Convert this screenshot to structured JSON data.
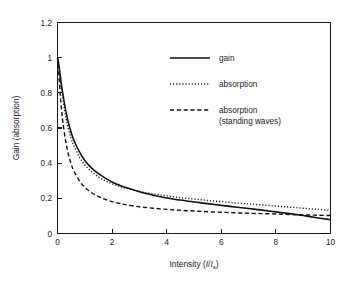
{
  "chart_data": {
    "type": "line",
    "title": "",
    "xlabel": "Intensity (I/I_s)",
    "xlabel_main": "Intensity (",
    "xlabel_var": "I",
    "xlabel_slash": "/",
    "xlabel_var2": "I",
    "xlabel_sub": "s",
    "xlabel_close": ")",
    "ylabel": "Gain (absorption)",
    "xlim": [
      0,
      10
    ],
    "ylim": [
      0,
      1.2
    ],
    "xticks": [
      0,
      2,
      4,
      6,
      8,
      10
    ],
    "xtick_labels": [
      "0",
      "2",
      "4",
      "6",
      "8",
      "10"
    ],
    "yticks": [
      0,
      0.2,
      0.4,
      0.6,
      0.8,
      1,
      1.2
    ],
    "ytick_labels": [
      "0",
      "0.2",
      "0.4",
      "0.6",
      "0.8",
      "1",
      "1.2"
    ],
    "grid": false,
    "legend_position": "upper right",
    "frame": "box",
    "series": [
      {
        "name": "gain",
        "style": "solid",
        "color": "#111111",
        "x": [
          0,
          0.05,
          0.1,
          0.15,
          0.2,
          0.3,
          0.4,
          0.5,
          0.6,
          0.8,
          1.0,
          1.25,
          1.5,
          1.75,
          2.0,
          2.25,
          2.5,
          3.0,
          3.5,
          4.0,
          4.5,
          5.0,
          5.5,
          6.0,
          6.5,
          7.0,
          7.5,
          8.0,
          8.5,
          9.0,
          9.5,
          10.0
        ],
        "y": [
          1.0,
          0.96,
          0.9,
          0.84,
          0.79,
          0.7,
          0.63,
          0.575,
          0.53,
          0.465,
          0.415,
          0.372,
          0.34,
          0.315,
          0.293,
          0.276,
          0.262,
          0.237,
          0.218,
          0.202,
          0.19,
          0.179,
          0.17,
          0.16,
          0.151,
          0.142,
          0.133,
          0.123,
          0.113,
          0.102,
          0.09,
          0.079
        ]
      },
      {
        "name": "absorption",
        "style": "dotted",
        "color": "#111111",
        "x": [
          0,
          0.05,
          0.1,
          0.15,
          0.2,
          0.3,
          0.4,
          0.5,
          0.6,
          0.8,
          1.0,
          1.25,
          1.5,
          1.75,
          2.0,
          2.25,
          2.5,
          3.0,
          3.5,
          4.0,
          4.5,
          5.0,
          5.5,
          6.0,
          6.5,
          7.0,
          7.5,
          8.0,
          8.5,
          9.0,
          9.5,
          10.0
        ],
        "y": [
          1.0,
          0.94,
          0.875,
          0.815,
          0.76,
          0.665,
          0.595,
          0.54,
          0.5,
          0.435,
          0.39,
          0.352,
          0.322,
          0.3,
          0.283,
          0.269,
          0.258,
          0.24,
          0.226,
          0.214,
          0.204,
          0.196,
          0.188,
          0.181,
          0.174,
          0.168,
          0.162,
          0.156,
          0.15,
          0.144,
          0.138,
          0.132
        ]
      },
      {
        "name": "absorption (standing waves)",
        "style": "dashed",
        "color": "#111111",
        "label_line1": "absorption",
        "label_line2": "(standing waves)",
        "x": [
          0,
          0.05,
          0.1,
          0.15,
          0.2,
          0.3,
          0.4,
          0.5,
          0.6,
          0.8,
          1.0,
          1.25,
          1.5,
          1.75,
          2.0,
          2.25,
          2.5,
          3.0,
          3.5,
          4.0,
          4.5,
          5.0,
          5.5,
          6.0,
          6.5,
          7.0,
          7.5,
          8.0,
          8.5,
          9.0,
          9.5,
          10.0
        ],
        "y": [
          1.0,
          0.9,
          0.79,
          0.7,
          0.63,
          0.525,
          0.45,
          0.395,
          0.355,
          0.3,
          0.262,
          0.232,
          0.21,
          0.194,
          0.181,
          0.172,
          0.164,
          0.152,
          0.144,
          0.137,
          0.132,
          0.128,
          0.124,
          0.121,
          0.118,
          0.115,
          0.113,
          0.111,
          0.108,
          0.106,
          0.104,
          0.102
        ]
      }
    ],
    "legend": [
      {
        "label": "gain",
        "style": "solid"
      },
      {
        "label": "absorption",
        "style": "dotted"
      },
      {
        "label": "absorption",
        "label2": "(standing waves)",
        "style": "dashed"
      }
    ]
  }
}
